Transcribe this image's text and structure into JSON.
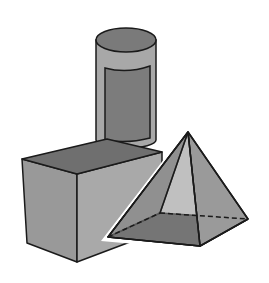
{
  "figure": {
    "title": "",
    "shapes": [
      {
        "name": "cylinder",
        "label": ""
      },
      {
        "name": "cube",
        "label": ""
      },
      {
        "name": "square-pyramid",
        "label": ""
      }
    ],
    "colors": {
      "background": "#ffffff",
      "outline": "#1a1a1a",
      "cylinder_top": "#7a7a7a",
      "cylinder_side": "#a8a8a8",
      "cylinder_label": "#7c7c7c",
      "cube_top": "#6f6f6f",
      "cube_front": "#999999",
      "cube_right": "#a9a9a9",
      "pyramid_left": "#8a8a8a",
      "pyramid_right": "#9a9a9a",
      "pyramid_base": "#5a5a5a",
      "pyramid_front": "#8c8c8c"
    }
  }
}
